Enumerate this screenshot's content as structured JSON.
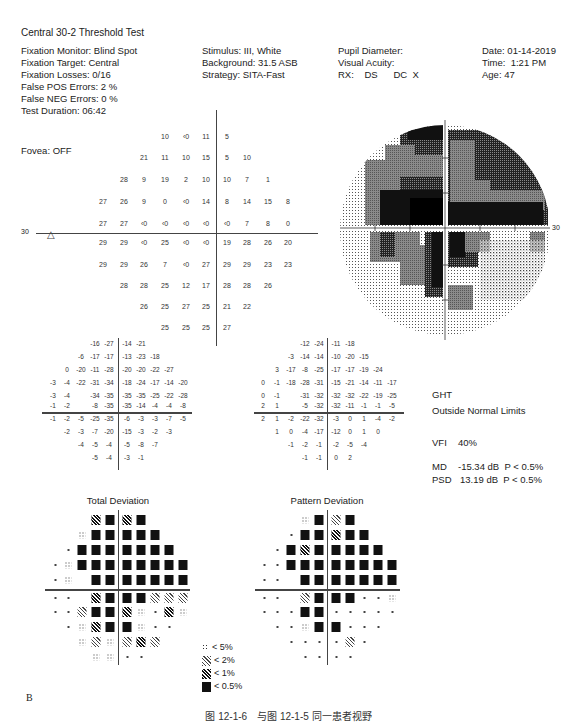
{
  "report": {
    "title": "Central 30-2 Threshold Test",
    "left_info": [
      "Fixation Monitor: Blind Spot",
      "Fixation Target: Central",
      "Fixation Losses: 0/16",
      "False POS Errors:  2 %",
      "False NEG Errors:  0 %",
      "Test Duration: 06:42"
    ],
    "fovea": "Fovea: OFF",
    "mid_info": [
      "Stimulus: III, White",
      "Background: 31.5 ASB",
      "Strategy: SITA-Fast"
    ],
    "right_info": [
      "Pupil Diameter:",
      "Visual Acuity:",
      "RX:    DS      DC  X"
    ],
    "far_right_info": [
      "Date: 01-14-2019",
      "Time:  1:21 PM",
      "Age: 47"
    ]
  },
  "threshold_plot": {
    "axis_label_left": "30",
    "axis_label_right": "30",
    "rows": [
      [
        "",
        "",
        "",
        "10",
        "<0",
        "11",
        "5",
        "",
        "",
        ""
      ],
      [
        "",
        "",
        "21",
        "11",
        "10",
        "15",
        "5",
        "10",
        "",
        ""
      ],
      [
        "",
        "28",
        "9",
        "19",
        "2",
        "10",
        "10",
        "7",
        "1",
        ""
      ],
      [
        "27",
        "26",
        "9",
        "0",
        "<0",
        "14",
        "8",
        "14",
        "15",
        "8"
      ],
      [
        "27",
        "27",
        "<0",
        "<0",
        "<0",
        "<0",
        "<0",
        "7",
        "8",
        "0"
      ],
      [
        "29",
        "29",
        "<0",
        "25",
        "<0",
        "<0",
        "19",
        "28",
        "26",
        "20"
      ],
      [
        "29",
        "29",
        "26",
        "7",
        "<0",
        "27",
        "29",
        "29",
        "23",
        "23"
      ],
      [
        "",
        "28",
        "28",
        "25",
        "12",
        "17",
        "28",
        "28",
        "26",
        ""
      ],
      [
        "",
        "",
        "26",
        "25",
        "27",
        "25",
        "21",
        "22",
        "",
        ""
      ],
      [
        "",
        "",
        "",
        "25",
        "25",
        "25",
        "27",
        "",
        "",
        ""
      ]
    ]
  },
  "total_deviation": {
    "title": "Total Deviation",
    "rows": [
      [
        "",
        "",
        "",
        "-16",
        "-27",
        "-14",
        "-21",
        "",
        "",
        ""
      ],
      [
        "",
        "",
        "-6",
        "-17",
        "-17",
        "-13",
        "-23",
        "-18",
        "",
        ""
      ],
      [
        "",
        "0",
        "-20",
        "-11",
        "-28",
        "-20",
        "-20",
        "-22",
        "-27",
        ""
      ],
      [
        "-3",
        "-4",
        "-22",
        "-31",
        "-34",
        "-18",
        "-24",
        "-17",
        "-14",
        "-20"
      ],
      [
        "-3",
        "-4",
        "",
        "-34",
        "-35",
        "-35",
        "-35",
        "-25",
        "-22",
        "-28"
      ],
      [
        "-1",
        "-2",
        "",
        "-8",
        "-35",
        "-35",
        "-14",
        "-4",
        "-4",
        "-8"
      ],
      [
        "-1",
        "-2",
        "-5",
        "-25",
        "-35",
        "-6",
        "-3",
        "-3",
        "-7",
        "-5"
      ],
      [
        "",
        "-2",
        "-3",
        "-7",
        "-20",
        "-15",
        "-3",
        "-2",
        "-3",
        ""
      ],
      [
        "",
        "",
        "-4",
        "-5",
        "-4",
        "-5",
        "-8",
        "-7",
        "",
        ""
      ],
      [
        "",
        "",
        "",
        "-5",
        "-4",
        "-3",
        "-1",
        "",
        "",
        ""
      ]
    ],
    "prob_rows": [
      [
        "",
        "",
        "",
        "p1",
        "black",
        "p1",
        "black",
        "",
        "",
        ""
      ],
      [
        "",
        "",
        "p5",
        "black",
        "black",
        "black",
        "black",
        "black",
        "",
        ""
      ],
      [
        "",
        "dot",
        "black",
        "black",
        "black",
        "black",
        "black",
        "black",
        "black",
        ""
      ],
      [
        "dot",
        "p5",
        "black",
        "black",
        "black",
        "black",
        "black",
        "black",
        "black",
        "black"
      ],
      [
        "dot",
        "p5",
        "",
        "black",
        "black",
        "black",
        "black",
        "black",
        "black",
        "black"
      ],
      [
        "dot",
        "dot",
        "",
        "p1",
        "black",
        "black",
        "black",
        "p2",
        "p2",
        "p2"
      ],
      [
        "dot",
        "dot",
        "p2",
        "black",
        "black",
        "p1",
        "p5",
        "dot",
        "p1",
        "p5"
      ],
      [
        "",
        "dot",
        "p5",
        "p1",
        "black",
        "black",
        "p5",
        "dot",
        "dot",
        ""
      ],
      [
        "",
        "",
        "p5",
        "p2",
        "p5",
        "p2",
        "p1",
        "p2",
        "",
        ""
      ],
      [
        "",
        "",
        "",
        "p5",
        "p5",
        "dot",
        "dot",
        "",
        "",
        ""
      ]
    ]
  },
  "pattern_deviation": {
    "title": "Pattern Deviation",
    "rows": [
      [
        "",
        "",
        "",
        "-12",
        "-24",
        "-11",
        "-18",
        "",
        "",
        ""
      ],
      [
        "",
        "",
        "-3",
        "-14",
        "-14",
        "-10",
        "-20",
        "-15",
        "",
        ""
      ],
      [
        "",
        "3",
        "-17",
        "-8",
        "-25",
        "-17",
        "-17",
        "-19",
        "-24",
        ""
      ],
      [
        "0",
        "-1",
        "-18",
        "-28",
        "-31",
        "-15",
        "-21",
        "-14",
        "-11",
        "-17"
      ],
      [
        "0",
        "-1",
        "",
        "-31",
        "-32",
        "-32",
        "-32",
        "-22",
        "-19",
        "-25"
      ],
      [
        "2",
        "1",
        "",
        "-5",
        "-32",
        "-32",
        "-11",
        "-1",
        "-1",
        "-5"
      ],
      [
        "2",
        "1",
        "-2",
        "-22",
        "-32",
        "-3",
        "0",
        "1",
        "-4",
        "-2"
      ],
      [
        "",
        "1",
        "0",
        "-4",
        "-17",
        "-12",
        "0",
        "1",
        "0",
        ""
      ],
      [
        "",
        "",
        "-1",
        "-2",
        "-1",
        "-2",
        "-5",
        "-4",
        "",
        ""
      ],
      [
        "",
        "",
        "",
        "-1",
        "-1",
        "0",
        "2",
        "",
        "",
        ""
      ]
    ],
    "prob_rows": [
      [
        "",
        "",
        "",
        "p5",
        "black",
        "p2",
        "black",
        "",
        "",
        ""
      ],
      [
        "",
        "",
        "dot",
        "black",
        "black",
        "p1",
        "black",
        "black",
        "",
        ""
      ],
      [
        "",
        "dot",
        "black",
        "p1",
        "black",
        "black",
        "black",
        "black",
        "black",
        ""
      ],
      [
        "dot",
        "dot",
        "black",
        "black",
        "black",
        "black",
        "black",
        "black",
        "black",
        "black"
      ],
      [
        "dot",
        "dot",
        "",
        "black",
        "black",
        "black",
        "black",
        "black",
        "black",
        "black"
      ],
      [
        "dot",
        "dot",
        "",
        "p2",
        "black",
        "black",
        "black",
        "dot",
        "dot",
        "p5"
      ],
      [
        "dot",
        "dot",
        "dot",
        "black",
        "black",
        "dot",
        "dot",
        "dot",
        "dot",
        "dot"
      ],
      [
        "",
        "dot",
        "dot",
        "p5",
        "black",
        "black",
        "dot",
        "dot",
        "dot",
        ""
      ],
      [
        "",
        "",
        "dot",
        "dot",
        "dot",
        "dot",
        "p2",
        "dot",
        "",
        ""
      ],
      [
        "",
        "",
        "",
        "dot",
        "dot",
        "dot",
        "dot",
        "",
        "",
        ""
      ]
    ]
  },
  "indices": {
    "ght_label": "GHT",
    "ght_value": "Outside Normal Limits",
    "vfi_label": "VFI",
    "vfi_value": "40%",
    "md_label": "MD",
    "md_value": "-15.34 dB  P < 0.5%",
    "psd_label": "PSD",
    "psd_value": "13.19 dB  P < 0.5%"
  },
  "legend": [
    {
      "symbol": "p5",
      "label": "< 5%"
    },
    {
      "symbol": "p2",
      "label": "< 2%"
    },
    {
      "symbol": "p1",
      "label": "< 1%"
    },
    {
      "symbol": "black",
      "label": "< 0.5%"
    }
  ],
  "panel_label": "B",
  "caption": "图 12-1-6　与图 12-1-5 同一患者视野"
}
